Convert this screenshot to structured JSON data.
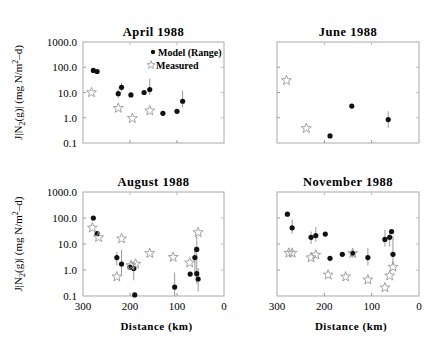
{
  "figure": {
    "ylabel": "J|N2(g)| (mg N/m2-d)",
    "xlabel": "Distance (km)",
    "legend": {
      "model": "Model (Range)",
      "measured": "Measured"
    }
  },
  "chart_data": [
    {
      "type": "scatter",
      "title": "April 1988",
      "xlabel": "",
      "ylabel": "J|N2(g)| (mg N/m^2-d)",
      "xlim": [
        300,
        0
      ],
      "ylim": [
        0.1,
        1000
      ],
      "yscale": "log",
      "yticks": [
        "1000.0",
        "100.0",
        "10.0",
        "1.0",
        "0.1"
      ],
      "xticks": [],
      "legend": [
        "Model (Range)",
        "Measured"
      ],
      "series": [
        {
          "name": "Model (Range)",
          "points": [
            [
              278,
              75
            ],
            [
              270,
              68
            ],
            [
              225,
              9
            ],
            [
              218,
              16
            ],
            [
              198,
              8
            ],
            [
              170,
              10
            ],
            [
              158,
              13
            ],
            [
              130,
              1.5
            ],
            [
              100,
              1.8
            ],
            [
              88,
              4.5
            ]
          ],
          "errorbars": [
            [
              225,
              6,
              14
            ],
            [
              218,
              11,
              24
            ],
            [
              158,
              8,
              35
            ],
            [
              88,
              2.5,
              12
            ]
          ]
        },
        {
          "name": "Measured",
          "points": [
            [
              282,
              10
            ],
            [
              225,
              2.4
            ],
            [
              195,
              0.95
            ],
            [
              158,
              1.9
            ]
          ]
        }
      ]
    },
    {
      "type": "scatter",
      "title": "June 1988",
      "xlim": [
        300,
        0
      ],
      "ylim": [
        0.1,
        1000
      ],
      "yscale": "log",
      "series": [
        {
          "name": "Model (Range)",
          "points": [
            [
              188,
              0.19
            ],
            [
              142,
              2.9
            ],
            [
              65,
              0.85
            ]
          ],
          "errorbars": [
            [
              65,
              0.4,
              1.8
            ]
          ]
        },
        {
          "name": "Measured",
          "points": [
            [
              280,
              30
            ],
            [
              238,
              0.38
            ]
          ]
        }
      ]
    },
    {
      "type": "scatter",
      "title": "August 1988",
      "xlabel": "Distance (km)",
      "ylabel": "J|N2(g)| (mg N/m^2-d)",
      "xlim": [
        300,
        0
      ],
      "ylim": [
        0.1,
        1000
      ],
      "yscale": "log",
      "xticks": [
        "300",
        "200",
        "100",
        "0"
      ],
      "yticks": [
        "1000.0",
        "100.0",
        "10.0",
        "1.0",
        "0.1"
      ],
      "series": [
        {
          "name": "Model (Range)",
          "points": [
            [
              278,
              100
            ],
            [
              270,
              25
            ],
            [
              228,
              3
            ],
            [
              218,
              1.7
            ],
            [
              200,
              1.3
            ],
            [
              192,
              1.15
            ],
            [
              190,
              0.11
            ],
            [
              105,
              0.22
            ],
            [
              72,
              0.7
            ],
            [
              62,
              3
            ],
            [
              58,
              6.2
            ],
            [
              58,
              0.72
            ],
            [
              55,
              0.45
            ]
          ],
          "errorbars": [
            [
              228,
              1.5,
              5
            ],
            [
              218,
              0.6,
              6
            ],
            [
              192,
              0.4,
              2
            ],
            [
              105,
              0.1,
              0.8
            ],
            [
              62,
              0.8,
              8
            ],
            [
              58,
              0.3,
              20
            ],
            [
              55,
              0.15,
              1.2
            ]
          ]
        },
        {
          "name": "Measured",
          "points": [
            [
              280,
              42
            ],
            [
              267,
              18
            ],
            [
              228,
              0.55
            ],
            [
              218,
              16
            ],
            [
              198,
              1.5
            ],
            [
              188,
              1.7
            ],
            [
              158,
              4.4
            ],
            [
              108,
              3.1
            ],
            [
              73,
              1.9
            ],
            [
              55,
              28
            ]
          ]
        }
      ]
    },
    {
      "type": "scatter",
      "title": "November 1988",
      "xlabel": "Distance (km)",
      "xlim": [
        300,
        0
      ],
      "ylim": [
        0.1,
        1000
      ],
      "yscale": "log",
      "xticks": [
        "300",
        "200",
        "100",
        "0"
      ],
      "series": [
        {
          "name": "Model (Range)",
          "points": [
            [
              278,
              140
            ],
            [
              268,
              42
            ],
            [
              228,
              18
            ],
            [
              218,
              21
            ],
            [
              198,
              24
            ],
            [
              188,
              2.8
            ],
            [
              162,
              4
            ],
            [
              140,
              4.4
            ],
            [
              108,
              3
            ],
            [
              72,
              15
            ],
            [
              62,
              18
            ],
            [
              58,
              30
            ],
            [
              55,
              4
            ]
          ],
          "errorbars": [
            [
              268,
              25,
              90
            ],
            [
              228,
              10,
              30
            ],
            [
              218,
              12,
              45
            ],
            [
              140,
              3,
              6
            ],
            [
              108,
              1.5,
              7
            ],
            [
              72,
              8,
              35
            ],
            [
              62,
              8,
              30
            ],
            [
              55,
              1.5,
              20
            ]
          ]
        },
        {
          "name": "Measured",
          "points": [
            [
              275,
              4.5
            ],
            [
              268,
              4.5
            ],
            [
              228,
              3
            ],
            [
              218,
              3.8
            ],
            [
              192,
              0.65
            ],
            [
              140,
              4.4
            ],
            [
              155,
              0.55
            ],
            [
              108,
              0.42
            ],
            [
              72,
              0.21
            ],
            [
              62,
              0.6
            ],
            [
              55,
              1.3
            ]
          ]
        }
      ]
    }
  ]
}
